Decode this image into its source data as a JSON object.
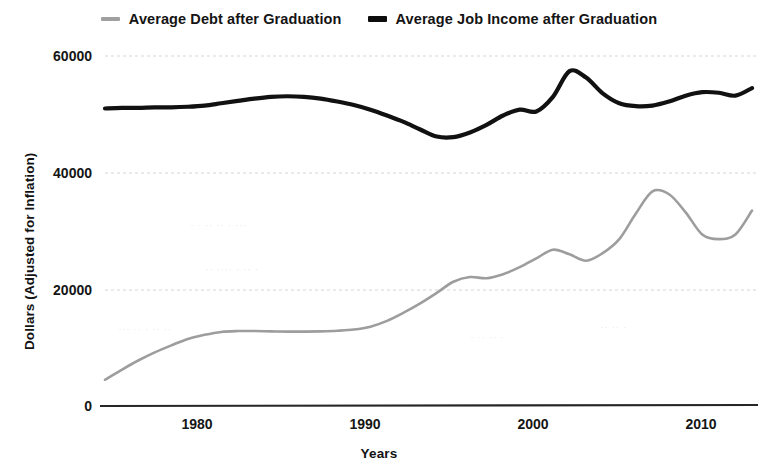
{
  "legend": {
    "position": "top-center",
    "entries": [
      {
        "label": "Average Debt after Graduation",
        "color": "#9d9d9d",
        "key": "debt"
      },
      {
        "label": "Average Job Income after Graduation",
        "color": "#111111",
        "key": "income"
      }
    ]
  },
  "axes": {
    "x_title": "Years",
    "y_title": "Dollars (Adjusted for Inflation)",
    "x_ticks": [
      "1980",
      "1990",
      "2000",
      "2010"
    ],
    "y_ticks": [
      "0",
      "20000",
      "40000",
      "60000"
    ]
  },
  "chart_data": {
    "type": "line",
    "title": "",
    "subtitle": "",
    "xlabel": "Years",
    "ylabel": "Dollars (Adjusted for Inflation)",
    "xlim": [
      1974,
      2013
    ],
    "ylim": [
      0,
      62000
    ],
    "xticks": [
      1980,
      1990,
      2000,
      2010
    ],
    "yticks": [
      0,
      20000,
      40000,
      60000
    ],
    "grid": "horizontal-dashed",
    "legend_position": "top-center",
    "x": [
      1974,
      1975,
      1976,
      1977,
      1978,
      1979,
      1980,
      1981,
      1982,
      1983,
      1984,
      1985,
      1986,
      1987,
      1988,
      1989,
      1990,
      1991,
      1992,
      1993,
      1994,
      1995,
      1996,
      1997,
      1998,
      1999,
      2000,
      2001,
      2002,
      2003,
      2004,
      2005,
      2006,
      2007,
      2008,
      2009,
      2010,
      2011,
      2012,
      2013
    ],
    "series": [
      {
        "name": "Average Debt after Graduation",
        "color": "#9d9d9d",
        "values": [
          4500,
          6200,
          7800,
          9200,
          10400,
          11500,
          12200,
          12700,
          12850,
          12850,
          12800,
          12750,
          12750,
          12800,
          12900,
          13100,
          13600,
          14600,
          16000,
          17600,
          19400,
          21300,
          22100,
          21900,
          22600,
          23800,
          25300,
          26800,
          26000,
          24900,
          26200,
          28600,
          33000,
          36800,
          36300,
          33200,
          29400,
          28600,
          29400,
          33500
        ]
      },
      {
        "name": "Average Job Income after Graduation",
        "color": "#111111",
        "values": [
          51000,
          51100,
          51100,
          51200,
          51200,
          51300,
          51500,
          51900,
          52300,
          52700,
          53000,
          53100,
          53000,
          52700,
          52200,
          51600,
          50800,
          49800,
          48700,
          47400,
          46200,
          46100,
          46900,
          48200,
          49800,
          50800,
          50500,
          53000,
          57400,
          56300,
          53600,
          51900,
          51400,
          51500,
          52200,
          53200,
          53800,
          53700,
          53200,
          54500
        ]
      }
    ]
  }
}
